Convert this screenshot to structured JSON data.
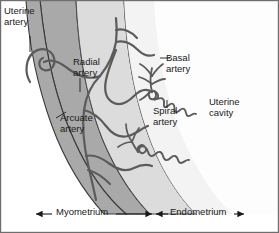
{
  "figure": {
    "background_color": "#ffffff",
    "border_color": "#6e6e6e",
    "width": 279,
    "height": 233
  },
  "zones": [
    {
      "key": "myometrium",
      "label": "Myometrium",
      "fill": "#a9a9a9",
      "stroke": "#3a3a3a"
    },
    {
      "key": "endometrium",
      "label": "Endometrium",
      "fill": "#dcdcdc",
      "stroke": "#4a4a4a"
    },
    {
      "key": "uterine_cavity",
      "label": "Uterine cavity",
      "fill": "#ffffff",
      "stroke": "#5a5a5a"
    }
  ],
  "labels": {
    "uterine_artery": "Uterine\nartery",
    "uterine_artery_line1": "Uterine",
    "uterine_artery_line2": "artery",
    "radial_artery_line1": "Radial",
    "radial_artery_line2": "artery",
    "arcuate_artery_line1": "Arcuate",
    "arcuate_artery_line2": "artery",
    "basal_artery_line1": "Basal",
    "basal_artery_line2": "artery",
    "spiral_artery_line1": "Spiral",
    "spiral_artery_line2": "artery",
    "uterine_cavity_line1": "Uterine",
    "uterine_cavity_line2": "cavity",
    "myometrium": "Myometrium",
    "endometrium": "Endometrium"
  },
  "vessels": {
    "stroke_color": "#5b5b5b",
    "names": [
      "uterine artery",
      "arcuate artery",
      "radial artery",
      "basal artery",
      "spiral artery"
    ]
  },
  "scale_bars": [
    {
      "key": "myometrium",
      "label": "Myometrium",
      "arrows": "both"
    },
    {
      "key": "endometrium",
      "label": "Endometrium",
      "arrows": "both"
    }
  ]
}
